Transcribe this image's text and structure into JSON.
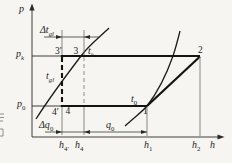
{
  "figure": {
    "kind": "pressure-enthalpy refrigeration cycle diagram (subcooled cycle)",
    "axes": {
      "y_label": "p",
      "x_label": "h"
    },
    "pressure_levels": {
      "pk": {
        "base": "p",
        "sub": "k"
      },
      "p0": {
        "base": "p",
        "sub": "0"
      }
    },
    "state_points": {
      "p1": "1",
      "p2": "2",
      "p3": "3",
      "p3_prime": "3′",
      "p4": "4",
      "p4_prime": "4′"
    },
    "isotherms": {
      "tk": {
        "base": "t",
        "sub": "k"
      },
      "t0": {
        "base": "t",
        "sub": "0"
      },
      "tgl": {
        "base": "t",
        "sub": "gl"
      }
    },
    "dimensions": {
      "subcooling": {
        "base": "Δt",
        "sub": "gl"
      },
      "extra_effect": {
        "base": "Δq",
        "sub": "0"
      },
      "refrig_effect": {
        "base": "q",
        "sub": "0"
      }
    },
    "enthalpy_ticks": {
      "h4p": {
        "base": "h",
        "sub": "4′"
      },
      "h4": {
        "base": "h",
        "sub": "4"
      },
      "h1": {
        "base": "h",
        "sub": "1"
      },
      "h2": {
        "base": "h",
        "sub": "2"
      }
    },
    "colors": {
      "ink": "#2a2a27",
      "heavy_line": "#14140f",
      "light_gray": "#8f8f8a",
      "background": "#f6f5f1"
    }
  }
}
